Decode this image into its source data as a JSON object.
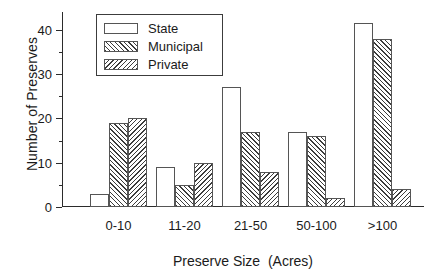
{
  "chart_data": {
    "type": "bar",
    "title": "",
    "xlabel": "Preserve Size  (Acres)",
    "ylabel": "Number of Preserves",
    "categories": [
      "0-10",
      "11-20",
      "21-50",
      "50-100",
      ">100"
    ],
    "series": [
      {
        "name": "State",
        "values": [
          3,
          9,
          27,
          17,
          41.5
        ],
        "fill": "none"
      },
      {
        "name": "Municipal",
        "values": [
          19,
          5,
          17,
          16,
          38
        ],
        "fill": "forward-hatch"
      },
      {
        "name": "Private",
        "values": [
          20,
          10,
          8,
          2,
          4
        ],
        "fill": "back-hatch"
      }
    ],
    "ylim": [
      0,
      44
    ],
    "yticks": [
      0,
      10,
      20,
      30,
      40
    ],
    "ytick_labels": [
      "0",
      "10",
      "20",
      "30",
      "40"
    ],
    "yminor_step": 5,
    "grid": false,
    "legend_position": "upper-left-inside",
    "axis_color": "#2b2b2b",
    "bar_edge_color": "#555555",
    "hatch_color": "#3c3c3c",
    "background": "#ffffff"
  }
}
